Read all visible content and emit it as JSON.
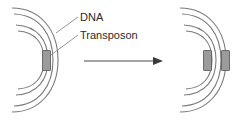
{
  "figure": {
    "title": "",
    "background_color": "#ffffff",
    "width": 239,
    "height": 120
  },
  "labels": {
    "dna": "DNA",
    "transposon": "Transposon"
  },
  "colors": {
    "arc_stroke": "#7a7a7a",
    "transposon_fill": "#9b9b9b",
    "transposon_stroke": "#5f5f5f",
    "arrow": "#3a3a3a",
    "leader_line": "#8a8a8a",
    "text": "#2b2b2b"
  },
  "left_panel": {
    "name": "chromosome-before",
    "arc_count": 4,
    "transposon_count": 1,
    "transposons": [
      {
        "name": "transposon-original",
        "arc_index": 3,
        "position": "inner-arc"
      }
    ]
  },
  "right_panel": {
    "name": "chromosome-after",
    "arc_count": 4,
    "transposon_count": 2,
    "transposons": [
      {
        "name": "transposon-original",
        "arc_index": 3,
        "position": "inner-arc"
      },
      {
        "name": "transposon-copy",
        "arc_index": 4,
        "position": "outer-arc"
      }
    ]
  },
  "arrow": {
    "name": "transposition-arrow",
    "direction": "right",
    "label": ""
  }
}
